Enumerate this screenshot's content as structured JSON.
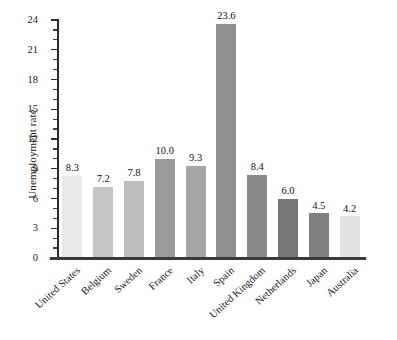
{
  "chart_data": {
    "type": "bar",
    "title": "",
    "xlabel": "",
    "ylabel": "Unemployment rate",
    "ylim": [
      0,
      24
    ],
    "ytick_step": 3,
    "yminor_step": 1,
    "grid": false,
    "legend": null,
    "categories": [
      "United States",
      "Belgium",
      "Sweden",
      "France",
      "Italy",
      "Spain",
      "United Kingdom",
      "Netherlands",
      "Japan",
      "Australia"
    ],
    "values": [
      8.3,
      7.2,
      7.8,
      10.0,
      9.3,
      23.6,
      8.4,
      6.0,
      4.5,
      4.2
    ],
    "value_labels": [
      "8.3",
      "7.2",
      "7.8",
      "10.0",
      "9.3",
      "23.6",
      "8.4",
      "6.0",
      "4.5",
      "4.2"
    ],
    "bar_colors": [
      "#e9e9e9",
      "#c5c5c5",
      "#bdbdbd",
      "#9a9a9a",
      "#a6a6a6",
      "#8f8f8f",
      "#8a8a8a",
      "#787878",
      "#808080",
      "#e0e0e0"
    ],
    "ytick_labels": [
      "0",
      "3",
      "6",
      "9",
      "12",
      "15",
      "18",
      "21",
      "24"
    ],
    "ytick_values": [
      0,
      3,
      6,
      9,
      12,
      15,
      18,
      21,
      24
    ],
    "axis_color": "#2b2b2b",
    "text_color": "#1a1a1a",
    "background_color": "#ffffff"
  }
}
